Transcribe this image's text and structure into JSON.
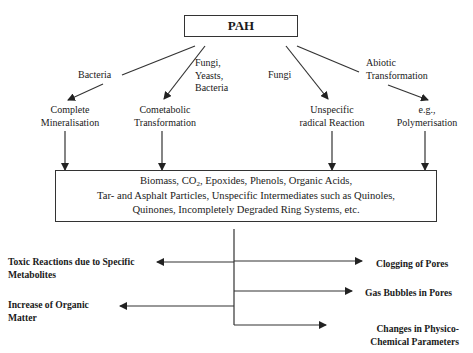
{
  "diagram": {
    "root": {
      "label": "PAH"
    },
    "pathways": [
      {
        "agent": "Bacteria",
        "process": [
          "Complete",
          "Mineralisation"
        ]
      },
      {
        "agent": [
          "Fungi,",
          "Yeasts,",
          "Bacteria"
        ],
        "process": [
          "Cometabolic",
          "Transformation"
        ]
      },
      {
        "agent": "Fungi",
        "process": [
          "Unspecific",
          "radical Reaction"
        ]
      },
      {
        "agent": [
          "Abiotic",
          "Transformation"
        ],
        "process": [
          "e.g.,",
          "Polymerisation"
        ]
      }
    ],
    "products": {
      "line1_pre": "Biomass, CO",
      "line1_sub": "2",
      "line1_post": ", Epoxides, Phenols, Organic Acids,",
      "line2": "Tar- and Asphalt Particles, Unspecific Intermediates such as Quinoles,",
      "line3": "Quinones, Incompletely Degraded Ring Systems, etc."
    },
    "effects": {
      "left": [
        [
          "Toxic Reactions due to Specific",
          "Metabolites"
        ],
        [
          "Increase of Organic",
          "Matter"
        ]
      ],
      "right": [
        [
          "Clogging of Pores"
        ],
        [
          "Gas Bubbles in Pores"
        ],
        [
          "Changes in Physico-",
          "Chemical Parameters"
        ]
      ]
    }
  }
}
